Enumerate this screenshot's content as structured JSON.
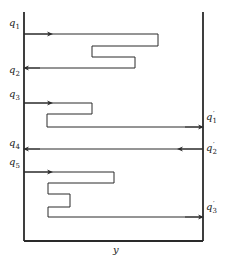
{
  "diagram": {
    "axis_label": "y",
    "inlet_labels": [
      {
        "base": "q",
        "sub": "1"
      },
      {
        "base": "q",
        "sub": "2"
      },
      {
        "base": "q",
        "sub": "3"
      },
      {
        "base": "q",
        "sub": "4"
      },
      {
        "base": "q",
        "sub": "5"
      }
    ],
    "outlet_labels": [
      {
        "base": "q",
        "sub": "1",
        "prime": "′"
      },
      {
        "base": "q",
        "sub": "2",
        "prime": "′"
      },
      {
        "base": "q",
        "sub": "3",
        "prime": "′"
      }
    ],
    "colors": {
      "line": "#2a2a2a",
      "background": "#ffffff"
    }
  }
}
